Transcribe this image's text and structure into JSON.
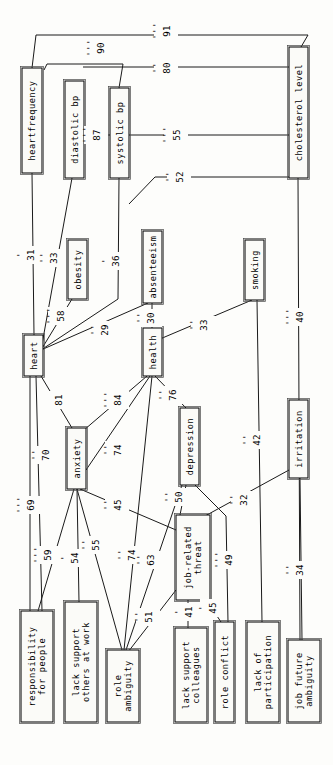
{
  "diagram": {
    "type": "path-diagram",
    "orientation": "rotated-90",
    "background_color": "#fdfdfb",
    "line_color": "#1a1a1a",
    "node_fill": "#fbfbf8",
    "nodes": [
      {
        "id": "heartfrequency",
        "label": "heartfrequency",
        "x": 22,
        "y": 68,
        "w": 20,
        "h": 105,
        "lines": [
          "heartfrequency"
        ]
      },
      {
        "id": "diastolic_bp",
        "label": "diastolic bp",
        "x": 65,
        "y": 81,
        "w": 19,
        "h": 97,
        "lines": [
          "diastolic bp"
        ]
      },
      {
        "id": "systolic_bp",
        "label": "systolic bp",
        "x": 110,
        "y": 88,
        "w": 19,
        "h": 90,
        "lines": [
          "systolic bp"
        ]
      },
      {
        "id": "cholesterol_level",
        "label": "cholesterol level",
        "x": 289,
        "y": 47,
        "w": 19,
        "h": 131,
        "lines": [
          "cholesterol level"
        ]
      },
      {
        "id": "obesity",
        "label": "obesity",
        "x": 68,
        "y": 240,
        "w": 19,
        "h": 59,
        "lines": [
          "obesity"
        ]
      },
      {
        "id": "absenteeism",
        "label": "absenteeism",
        "x": 143,
        "y": 231,
        "w": 19,
        "h": 72,
        "lines": [
          "absenteeism"
        ]
      },
      {
        "id": "smoking",
        "label": "smoking",
        "x": 245,
        "y": 240,
        "w": 19,
        "h": 60,
        "lines": [
          "smoking"
        ]
      },
      {
        "id": "heart",
        "label": "heart",
        "x": 24,
        "y": 335,
        "w": 19,
        "h": 41,
        "lines": [
          "heart"
        ]
      },
      {
        "id": "health",
        "label": "health",
        "x": 143,
        "y": 328,
        "w": 19,
        "h": 48,
        "lines": [
          "health"
        ]
      },
      {
        "id": "anxiety",
        "label": "anxiety",
        "x": 67,
        "y": 428,
        "w": 19,
        "h": 61,
        "lines": [
          "anxiety"
        ]
      },
      {
        "id": "depression",
        "label": "depression",
        "x": 180,
        "y": 408,
        "w": 19,
        "h": 77,
        "lines": [
          "depression"
        ]
      },
      {
        "id": "irritation",
        "label": "irritation",
        "x": 289,
        "y": 400,
        "w": 19,
        "h": 78,
        "lines": [
          "irritation"
        ]
      },
      {
        "id": "job_related_threat",
        "label": "job-related threat",
        "x": 176,
        "y": 515,
        "w": 34,
        "h": 85,
        "lines": [
          "job-related",
          "threat"
        ]
      },
      {
        "id": "responsibility",
        "label": "responsibility for people",
        "x": 21,
        "y": 611,
        "w": 32,
        "h": 111,
        "lines": [
          "responsibility",
          "for people"
        ]
      },
      {
        "id": "lack_support_others",
        "label": "lack support others at work",
        "x": 65,
        "y": 602,
        "w": 32,
        "h": 120,
        "lines": [
          "lack support",
          "others at work"
        ]
      },
      {
        "id": "role_ambiguity",
        "label": "role ambiguity",
        "x": 107,
        "y": 650,
        "w": 32,
        "h": 72,
        "lines": [
          "role",
          "ambiguity"
        ]
      },
      {
        "id": "lack_support_colleagues",
        "label": "lack support colleagues",
        "x": 175,
        "y": 628,
        "w": 32,
        "h": 94,
        "lines": [
          "lack support",
          "colleagues"
        ]
      },
      {
        "id": "role_conflict",
        "label": "role conflict",
        "x": 215,
        "y": 622,
        "w": 19,
        "h": 100,
        "lines": [
          "role conflict"
        ]
      },
      {
        "id": "lack_participation",
        "label": "lack of participation",
        "x": 247,
        "y": 622,
        "w": 32,
        "h": 100,
        "lines": [
          "lack of",
          "participation"
        ]
      },
      {
        "id": "job_future_ambiguity",
        "label": "job future ambiguity",
        "x": 288,
        "y": 640,
        "w": 32,
        "h": 82,
        "lines": [
          "job future",
          "ambiguity"
        ]
      }
    ],
    "edges": [
      {
        "id": "e91",
        "from": "cholesterol_level",
        "to": "heartfrequency",
        "value": "91",
        "primes": "'''",
        "label_x": 166,
        "label_y": 31,
        "path": "M 301 47 L 308 35 L 36 35 L 32 68"
      },
      {
        "id": "e90",
        "from": "systolic_bp",
        "to": "heartfrequency",
        "value": "90",
        "primes": "'''",
        "label_x": 100,
        "label_y": 48,
        "path": "M 119 88 L 123 64 L 47 64 L 44 70"
      },
      {
        "id": "e80",
        "from": "cholesterol_level",
        "to": "diastolic_bp",
        "value": "80",
        "primes": "''",
        "label_x": 166,
        "label_y": 68,
        "path": "M 289 67 L 83 67"
      },
      {
        "id": "e87",
        "from": "diastolic_bp",
        "to": "systolic_bp",
        "value": "87",
        "primes": "'''",
        "label_x": 96,
        "label_y": 135,
        "path": "M 84 135 L 110 135"
      },
      {
        "id": "e55",
        "from": "cholesterol_level",
        "to": "systolic_bp",
        "value": "55",
        "primes": "'''",
        "label_x": 176,
        "label_y": 135,
        "path": "M 289 135 L 129 135"
      },
      {
        "id": "e52",
        "from": "cholesterol_level",
        "to": "heart",
        "value": "52",
        "primes": "''",
        "label_x": 179,
        "label_y": 177,
        "path": "M 289 177 L 155 177 L 129 204"
      },
      {
        "id": "e31",
        "from": "heartfrequency",
        "to": "heart",
        "value": "31",
        "primes": "'",
        "label_x": 30,
        "label_y": 255,
        "path": "M 32 173 L 34 335"
      },
      {
        "id": "e33a",
        "from": "diastolic_bp",
        "to": "heart",
        "value": "33",
        "primes": "''",
        "label_x": 53,
        "label_y": 258,
        "path": "M 72 178 L 41 350"
      },
      {
        "id": "e58",
        "from": "obesity",
        "to": "heart",
        "value": "58",
        "primes": "'''",
        "label_x": 60,
        "label_y": 316,
        "path": "M 72 299 L 41 350"
      },
      {
        "id": "e36",
        "from": "systolic_bp",
        "to": "heart",
        "value": "36",
        "primes": "'",
        "label_x": 115,
        "label_y": 261,
        "path": "M 119 178 L 118 299 L 41 350"
      },
      {
        "id": "e29",
        "from": "absenteeism",
        "to": "heart",
        "value": "29",
        "primes": "''",
        "label_x": 104,
        "label_y": 330,
        "path": "M 148 303 L 41 350"
      },
      {
        "id": "e30",
        "from": "absenteeism",
        "to": "health",
        "value": "30",
        "primes": "''",
        "label_x": 150,
        "label_y": 318,
        "path": "M 152 303 L 152 328"
      },
      {
        "id": "e33b",
        "from": "smoking",
        "to": "health",
        "value": "33",
        "primes": "''",
        "label_x": 203,
        "label_y": 325,
        "path": "M 252 300 L 160 339"
      },
      {
        "id": "e40",
        "from": "cholesterol_level",
        "to": "job_future_ambiguity",
        "value": "40",
        "primes": "'''",
        "label_x": 299,
        "label_y": 317,
        "path": "M 298 178 L 300 640"
      },
      {
        "id": "e81",
        "from": "heart",
        "to": "anxiety",
        "value": "81",
        "primes": "",
        "label_x": 58,
        "label_y": 400,
        "path": "M 41 376 L 72 428"
      },
      {
        "id": "e84",
        "from": "health",
        "to": "anxiety",
        "value": "84",
        "primes": "'''",
        "label_x": 117,
        "label_y": 400,
        "path": "M 147 376 L 84 430"
      },
      {
        "id": "e74a",
        "from": "health",
        "to": "anxiety",
        "value": "74",
        "primes": "''",
        "label_x": 117,
        "label_y": 450,
        "path": "M 150 376 L 86 470"
      },
      {
        "id": "e76",
        "from": "health",
        "to": "depression",
        "value": "76",
        "primes": "''",
        "label_x": 172,
        "label_y": 395,
        "path": "M 155 376 L 186 408"
      },
      {
        "id": "e70",
        "from": "heart",
        "to": "responsibility",
        "value": "70",
        "primes": "''",
        "label_x": 45,
        "label_y": 455,
        "path": "M 36 376 L 42 611"
      },
      {
        "id": "e69",
        "from": "heart",
        "to": "responsibility",
        "value": "69",
        "primes": "'''",
        "label_x": 30,
        "label_y": 505,
        "path": "M 30 376 L 30 611"
      },
      {
        "id": "e45a",
        "from": "anxiety",
        "to": "job_related_threat",
        "value": "45",
        "primes": "''",
        "label_x": 117,
        "label_y": 505,
        "path": "M 80 489 L 176 530"
      },
      {
        "id": "e50",
        "from": "depression",
        "to": "job_related_threat",
        "value": "50",
        "primes": "''",
        "label_x": 178,
        "label_y": 497,
        "path": "M 186 485 L 180 515"
      },
      {
        "id": "e32",
        "from": "irritation",
        "to": "job_related_threat",
        "value": "32",
        "primes": "''",
        "label_x": 243,
        "label_y": 500,
        "path": "M 289 470 L 205 516"
      },
      {
        "id": "e42",
        "from": "smoking",
        "to": "lack_participation",
        "value": "42",
        "primes": "''",
        "label_x": 256,
        "label_y": 440,
        "path": "M 257 300 L 262 622"
      },
      {
        "id": "e59",
        "from": "anxiety",
        "to": "responsibility",
        "value": "59",
        "primes": "'''",
        "label_x": 47,
        "label_y": 555,
        "path": "M 74 489 L 38 611"
      },
      {
        "id": "e54",
        "from": "anxiety",
        "to": "lack_support_others",
        "value": "54",
        "primes": "'",
        "label_x": 74,
        "label_y": 558,
        "path": "M 77 489 L 79 602"
      },
      {
        "id": "e55b",
        "from": "anxiety",
        "to": "role_ambiguity",
        "value": "55",
        "primes": "''",
        "label_x": 95,
        "label_y": 545,
        "path": "M 77 489 L 122 650"
      },
      {
        "id": "e74b",
        "from": "health",
        "to": "role_ambiguity",
        "value": "74",
        "primes": "''",
        "label_x": 131,
        "label_y": 555,
        "path": "M 152 376 L 124 650"
      },
      {
        "id": "e63",
        "from": "depression",
        "to": "role_ambiguity",
        "value": "63",
        "primes": "''",
        "label_x": 150,
        "label_y": 560,
        "path": "M 182 485 L 126 650"
      },
      {
        "id": "e51",
        "from": "job_related_threat",
        "to": "role_ambiguity",
        "value": "51",
        "primes": "''",
        "label_x": 148,
        "label_y": 617,
        "path": "M 176 590 L 128 652"
      },
      {
        "id": "e41",
        "from": "job_related_threat",
        "to": "lack_support_colleagues",
        "value": "41",
        "primes": "'",
        "label_x": 188,
        "label_y": 612,
        "path": "M 188 600 L 188 628"
      },
      {
        "id": "e45b",
        "from": "job_related_threat",
        "to": "role_conflict",
        "value": "45",
        "primes": "'",
        "label_x": 212,
        "label_y": 608,
        "path": "M 205 598 L 221 622"
      },
      {
        "id": "e49",
        "from": "depression",
        "to": "role_conflict",
        "value": "49",
        "primes": "'''",
        "label_x": 228,
        "label_y": 560,
        "path": "M 195 485 L 226 516 L 228 622"
      },
      {
        "id": "e34",
        "from": "irritation",
        "to": "job_future_ambiguity",
        "value": "34",
        "primes": "''",
        "label_x": 299,
        "label_y": 570,
        "path": "M 300 478 L 302 640"
      }
    ]
  }
}
